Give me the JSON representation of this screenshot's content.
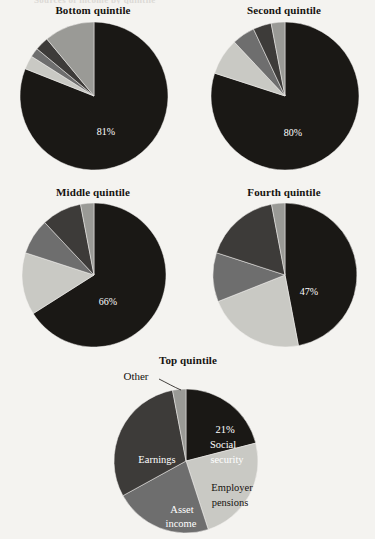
{
  "page": {
    "clipped_header_text": "Sources of income by quintile",
    "background_color": "#f4f3f0"
  },
  "palette": {
    "social_security": "#1a1815",
    "employer_pensions": "#c9c9c4",
    "asset_income": "#6e6e6e",
    "earnings": "#3d3b39",
    "other": "#9a9a96"
  },
  "legend_categories": [
    {
      "name": "Social security",
      "color": "#1a1815"
    },
    {
      "name": "Employer pensions",
      "color": "#c9c9c4"
    },
    {
      "name": "Asset income",
      "color": "#6e6e6e"
    },
    {
      "name": "Earnings",
      "color": "#3d3b39"
    },
    {
      "name": "Other",
      "color": "#9a9a96"
    }
  ],
  "charts": [
    {
      "id": "bottom-quintile",
      "title": "Bottom quintile",
      "center_label": "81%",
      "slices": [
        {
          "label": "Social security",
          "value": 81,
          "color": "#1a1815"
        },
        {
          "label": "Employer pensions",
          "value": 3,
          "color": "#c9c9c4"
        },
        {
          "label": "Asset income",
          "value": 2,
          "color": "#6e6e6e"
        },
        {
          "label": "Earnings",
          "value": 3,
          "color": "#3d3b39"
        },
        {
          "label": "Other",
          "value": 11,
          "color": "#9a9a96"
        }
      ]
    },
    {
      "id": "second-quintile",
      "title": "Second quintile",
      "center_label": "80%",
      "slices": [
        {
          "label": "Social security",
          "value": 80,
          "color": "#1a1815"
        },
        {
          "label": "Employer pensions",
          "value": 8,
          "color": "#c9c9c4"
        },
        {
          "label": "Asset income",
          "value": 5,
          "color": "#6e6e6e"
        },
        {
          "label": "Earnings",
          "value": 4,
          "color": "#3d3b39"
        },
        {
          "label": "Other",
          "value": 3,
          "color": "#9a9a96"
        }
      ]
    },
    {
      "id": "middle-quintile",
      "title": "Middle quintile",
      "center_label": "66%",
      "slices": [
        {
          "label": "Social security",
          "value": 66,
          "color": "#1a1815"
        },
        {
          "label": "Employer pensions",
          "value": 14,
          "color": "#c9c9c4"
        },
        {
          "label": "Asset income",
          "value": 8,
          "color": "#6e6e6e"
        },
        {
          "label": "Earnings",
          "value": 9,
          "color": "#3d3b39"
        },
        {
          "label": "Other",
          "value": 3,
          "color": "#9a9a96"
        }
      ]
    },
    {
      "id": "fourth-quintile",
      "title": "Fourth quintile",
      "center_label": "47%",
      "slices": [
        {
          "label": "Social security",
          "value": 47,
          "color": "#1a1815"
        },
        {
          "label": "Employer pensions",
          "value": 22,
          "color": "#c9c9c4"
        },
        {
          "label": "Asset income",
          "value": 11,
          "color": "#6e6e6e"
        },
        {
          "label": "Earnings",
          "value": 17,
          "color": "#3d3b39"
        },
        {
          "label": "Other",
          "value": 3,
          "color": "#9a9a96"
        }
      ]
    },
    {
      "id": "top-quintile",
      "title": "Top quintile",
      "center_label": "21%",
      "slices": [
        {
          "label": "Social security",
          "value": 21,
          "color": "#1a1815"
        },
        {
          "label": "Employer pensions",
          "value": 24,
          "color": "#c9c9c4"
        },
        {
          "label": "Asset income",
          "value": 22,
          "color": "#6e6e6e"
        },
        {
          "label": "Earnings",
          "value": 30,
          "color": "#3d3b39"
        },
        {
          "label": "Other",
          "value": 3,
          "color": "#9a9a96"
        }
      ],
      "annotations": {
        "social_security_lines": [
          "21%",
          "Social",
          "security"
        ],
        "employer_pensions_lines": [
          "Employer",
          "pensions"
        ],
        "asset_income_lines": [
          "Asset",
          "income"
        ],
        "earnings_lines": [
          "Earnings"
        ],
        "other_label": "Other"
      }
    }
  ],
  "chart_data": {
    "type": "pie",
    "title": "Sources of income by quintile",
    "multiples": 5,
    "categories": [
      "Social security",
      "Employer pensions",
      "Asset income",
      "Earnings",
      "Other"
    ],
    "colors": [
      "#1a1815",
      "#c9c9c4",
      "#6e6e6e",
      "#3d3b39",
      "#9a9a96"
    ],
    "units": "percent",
    "panels": [
      {
        "name": "Bottom quintile",
        "values": [
          81,
          3,
          2,
          3,
          11
        ],
        "labeled_value": "81%"
      },
      {
        "name": "Second quintile",
        "values": [
          80,
          8,
          5,
          4,
          3
        ],
        "labeled_value": "80%"
      },
      {
        "name": "Middle quintile",
        "values": [
          66,
          14,
          8,
          9,
          3
        ],
        "labeled_value": "66%"
      },
      {
        "name": "Fourth quintile",
        "values": [
          47,
          22,
          11,
          17,
          3
        ],
        "labeled_value": "47%"
      },
      {
        "name": "Top quintile",
        "values": [
          21,
          24,
          22,
          30,
          3
        ],
        "labeled_value": "21%"
      }
    ],
    "legend": "in-slice labels shown on Top quintile only",
    "grid": false,
    "start_angle_deg": 0,
    "direction": "clockwise"
  }
}
